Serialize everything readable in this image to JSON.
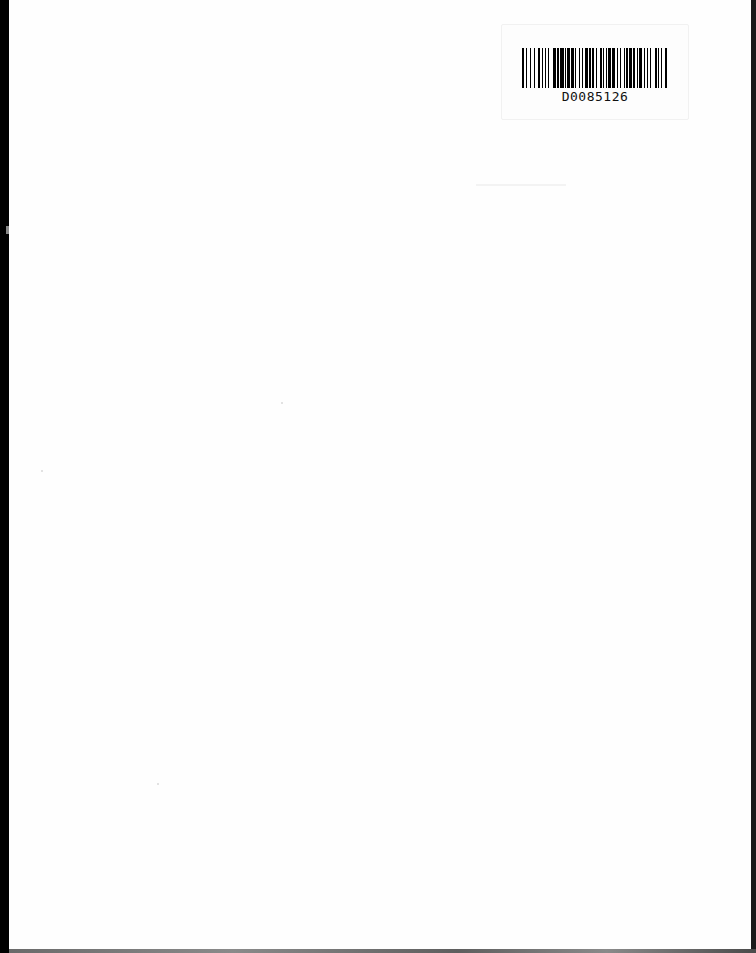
{
  "document": {
    "type": "scanned blank page",
    "barcode": {
      "label_text": "D0085126",
      "pattern": [
        2,
        2,
        1,
        3,
        1,
        2,
        1,
        3,
        2,
        2,
        1,
        2,
        1,
        2,
        1,
        3,
        3,
        1,
        2,
        1,
        4,
        1,
        1,
        1,
        3,
        1,
        2,
        1,
        1,
        3,
        1,
        2,
        1,
        2,
        3,
        1,
        2,
        1,
        1,
        2,
        1,
        3,
        2,
        1,
        1,
        2,
        1,
        1,
        3,
        1,
        2,
        2,
        1,
        2,
        1,
        3,
        1,
        1,
        2,
        1,
        3,
        1,
        1,
        2,
        1,
        1,
        3,
        2,
        1,
        2,
        1,
        2,
        1,
        3,
        2,
        1,
        1,
        2,
        1,
        3,
        2,
        2
      ]
    },
    "colors": {
      "page": "#fefefe",
      "scan_border": "#000000",
      "bars": "#000000"
    }
  }
}
